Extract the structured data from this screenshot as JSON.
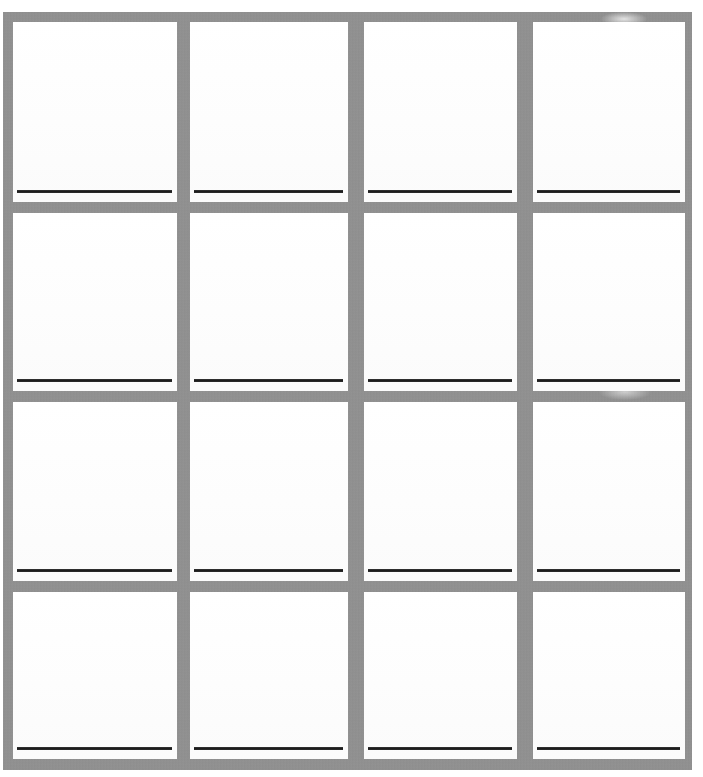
{
  "document": {
    "type": "blank-grid-worksheet",
    "title": "",
    "description": "Blank 4 by 4 grid of boxes, each box containing a single horizontal ruled writing line near its lower edge",
    "rows": 4,
    "columns": 4,
    "total_cells": 16
  },
  "colors": {
    "grid_border": "#8e8e8e",
    "cell_background": "#ffffff",
    "rule_line": "#1b1b1b",
    "page_background": "#ffffff"
  },
  "geometry": {
    "page_width": 703,
    "page_height": 777,
    "sheet_left": 3,
    "sheet_top": 12,
    "sheet_width": 689,
    "sheet_height": 758,
    "border_thickness": 10,
    "column_x": [
      13,
      190,
      364,
      533
    ],
    "column_width": [
      164,
      158,
      153,
      152
    ],
    "row_y": [
      22,
      213,
      402,
      592
    ],
    "row_height": [
      180,
      178,
      179,
      167
    ],
    "rule_line_offset_from_cell_bottom": 12,
    "rule_line_thickness": 3
  },
  "cells": [
    {
      "id": "cell-r1c1",
      "row": 1,
      "column": 1,
      "label": "",
      "content": "",
      "line_label": ""
    },
    {
      "id": "cell-r1c2",
      "row": 1,
      "column": 2,
      "label": "",
      "content": "",
      "line_label": ""
    },
    {
      "id": "cell-r1c3",
      "row": 1,
      "column": 3,
      "label": "",
      "content": "",
      "line_label": ""
    },
    {
      "id": "cell-r1c4",
      "row": 1,
      "column": 4,
      "label": "",
      "content": "",
      "line_label": ""
    },
    {
      "id": "cell-r2c1",
      "row": 2,
      "column": 1,
      "label": "",
      "content": "",
      "line_label": ""
    },
    {
      "id": "cell-r2c2",
      "row": 2,
      "column": 2,
      "label": "",
      "content": "",
      "line_label": ""
    },
    {
      "id": "cell-r2c3",
      "row": 2,
      "column": 3,
      "label": "",
      "content": "",
      "line_label": ""
    },
    {
      "id": "cell-r2c4",
      "row": 2,
      "column": 4,
      "label": "",
      "content": "",
      "line_label": ""
    },
    {
      "id": "cell-r3c1",
      "row": 3,
      "column": 1,
      "label": "",
      "content": "",
      "line_label": ""
    },
    {
      "id": "cell-r3c2",
      "row": 3,
      "column": 2,
      "label": "",
      "content": "",
      "line_label": ""
    },
    {
      "id": "cell-r3c3",
      "row": 3,
      "column": 3,
      "label": "",
      "content": "",
      "line_label": ""
    },
    {
      "id": "cell-r3c4",
      "row": 3,
      "column": 4,
      "label": "",
      "content": "",
      "line_label": ""
    },
    {
      "id": "cell-r4c1",
      "row": 4,
      "column": 1,
      "label": "",
      "content": "",
      "line_label": ""
    },
    {
      "id": "cell-r4c2",
      "row": 4,
      "column": 2,
      "label": "",
      "content": "",
      "line_label": ""
    },
    {
      "id": "cell-r4c3",
      "row": 4,
      "column": 3,
      "label": "",
      "content": "",
      "line_label": ""
    },
    {
      "id": "cell-r4c4",
      "row": 4,
      "column": 4,
      "label": "",
      "content": "",
      "line_label": ""
    }
  ]
}
